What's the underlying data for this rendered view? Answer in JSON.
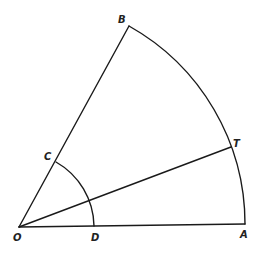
{
  "diagram": {
    "type": "circular sector construction",
    "stroke_color": "#1a1a1a",
    "background": "#ffffff",
    "points": {
      "O": {
        "label": "O",
        "x": 19,
        "y": 227,
        "lx": 13,
        "ly": 241
      },
      "A": {
        "label": "A",
        "x": 245,
        "y": 224,
        "lx": 240,
        "ly": 238
      },
      "B": {
        "label": "B",
        "x": 129,
        "y": 26,
        "lx": 118,
        "ly": 23
      },
      "C": {
        "label": "C",
        "x": 56,
        "y": 162,
        "lx": 44,
        "ly": 160
      },
      "D": {
        "label": "D",
        "x": 94,
        "y": 226,
        "lx": 91,
        "ly": 241
      },
      "T": {
        "label": "T",
        "x": 231,
        "y": 147,
        "lx": 233,
        "ly": 147
      }
    },
    "segments": [
      {
        "name": "segment-OA",
        "from": "O",
        "to": "A"
      },
      {
        "name": "segment-OB",
        "from": "O",
        "to": "B"
      },
      {
        "name": "segment-OT",
        "from": "O",
        "to": "T"
      }
    ],
    "arcs": [
      {
        "name": "arc-AB",
        "from": "A",
        "to": "B",
        "radius": 227
      },
      {
        "name": "arc-DC",
        "from": "D",
        "to": "C",
        "radius": 75
      }
    ]
  }
}
